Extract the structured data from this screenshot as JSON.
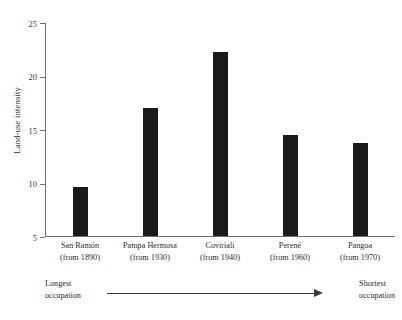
{
  "chart_data": {
    "type": "bar",
    "title": "",
    "xlabel": "",
    "ylabel": "Land-use intensity",
    "categories": [
      "San Ramón",
      "Pampa Hermosa",
      "Coviriali",
      "Perené",
      "Pangoa"
    ],
    "category_sublabels": [
      "(from 1890)",
      "(from 1930)",
      "(from 1940)",
      "(from 1960)",
      "(from 1970)"
    ],
    "values": [
      9.6,
      17.0,
      22.2,
      14.4,
      13.7
    ],
    "ylim": [
      5,
      25
    ],
    "yticks": [
      5,
      10,
      15,
      20,
      25
    ],
    "ytick_labels": [
      "5",
      "10",
      "15",
      "20",
      "25"
    ],
    "grid": false,
    "legend": false,
    "bar_color": "#1a1a1a",
    "axis_color": "#6f6f6f"
  },
  "annotation": {
    "left_line1": "Longest",
    "left_line2": "occupation",
    "right_line1": "Shortest",
    "right_line2": "occupation"
  }
}
